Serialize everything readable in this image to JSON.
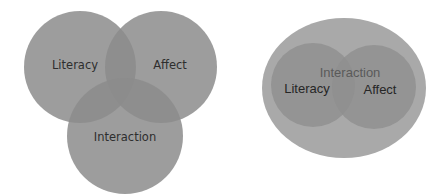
{
  "diagrams": [
    {
      "type": "venn-three-overlapping",
      "circles": [
        {
          "label": "Literacy"
        },
        {
          "label": "Affect"
        },
        {
          "label": "Interaction"
        }
      ]
    },
    {
      "type": "nested-venn",
      "container": {
        "label": "Interaction"
      },
      "circles": [
        {
          "label": "Literacy"
        },
        {
          "label": "Affect"
        }
      ]
    }
  ],
  "colors": {
    "background": "#ffffff",
    "circle_fill": "#9a9a9a",
    "outer_fill": "#a8a8a8",
    "inner_fill": "#939393",
    "text": "#2e2e2e"
  }
}
